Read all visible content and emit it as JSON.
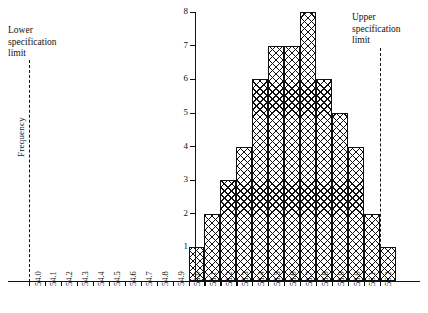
{
  "chart_data": {
    "type": "bar",
    "title": "",
    "xlabel": "",
    "ylabel": "Frequency",
    "ylim": [
      0,
      8
    ],
    "yticks": [
      1,
      2,
      3,
      4,
      5,
      6,
      7,
      8
    ],
    "grid": false,
    "legend": "none",
    "xticks": [
      "54.0",
      "54.1",
      "54.2",
      "54.3",
      "54.4",
      "54.5",
      "54.6",
      "54.7",
      "54.8",
      "54.9",
      "55.0",
      "55.1",
      "55.2",
      "55.3",
      "55.4",
      "55.5",
      "55.6",
      "55.7",
      "55.8",
      "55.9",
      "56.0",
      "56.1",
      "56.2"
    ],
    "categories": [
      "55.0",
      "55.1",
      "55.2",
      "55.3",
      "55.4",
      "55.5",
      "55.6",
      "55.7",
      "55.8",
      "55.9",
      "56.0",
      "56.1",
      "56.2"
    ],
    "values": [
      1,
      2,
      3,
      4,
      6,
      7,
      7,
      8,
      6,
      5,
      4,
      2,
      1
    ],
    "annotations": [
      {
        "name": "lower-specification-limit",
        "text": "Lower\nspecification\nlimit",
        "x": "54.0",
        "line": "dashed"
      },
      {
        "name": "upper-specification-limit",
        "text": "Upper\nspecification\nlimit",
        "x": "56.05",
        "line": "dashed"
      }
    ]
  },
  "annotations": {
    "lower": {
      "line1": "Lower",
      "line2": "specification",
      "line3": "limit"
    },
    "upper": {
      "line1": "Upper",
      "line2": "specification",
      "line3": "limit"
    }
  },
  "axes": {
    "y_title": "Frequency"
  },
  "colors": {
    "ink": "#111111",
    "background": "#ffffff"
  }
}
